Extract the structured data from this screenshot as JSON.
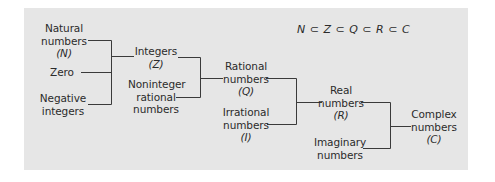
{
  "diagram": {
    "formula": "N ⊂ Z ⊂ Q ⊂ R ⊂ C",
    "colors": {
      "panel": "#e6e6e6",
      "text": "#2b2b2b",
      "line": "#3a3a3a"
    },
    "nodes": {
      "natural": {
        "line1": "Natural",
        "line2": "numbers",
        "symbol": "(N)"
      },
      "zero": {
        "line1": "Zero"
      },
      "negative": {
        "line1": "Negative",
        "line2": "integers"
      },
      "integers": {
        "line1": "Integers",
        "symbol": "(Z)"
      },
      "noninteger": {
        "line1": "Noninteger",
        "line2": "rational",
        "line3": "numbers"
      },
      "rational": {
        "line1": "Rational",
        "line2": "numbers",
        "symbol": "(Q)"
      },
      "irrational": {
        "line1": "Irrational",
        "line2": "numbers",
        "symbol": "(I)"
      },
      "real": {
        "line1": "Real",
        "line2": "numbers",
        "symbol": "(R)"
      },
      "imaginary": {
        "line1": "Imaginary",
        "line2": "numbers"
      },
      "complex": {
        "line1": "Complex",
        "line2": "numbers",
        "symbol": "(C)"
      }
    },
    "edges": [
      {
        "from": [
          "natural",
          "zero",
          "negative"
        ],
        "to": "integers"
      },
      {
        "from": [
          "integers",
          "noninteger"
        ],
        "to": "rational"
      },
      {
        "from": [
          "rational",
          "irrational"
        ],
        "to": "real"
      },
      {
        "from": [
          "real",
          "imaginary"
        ],
        "to": "complex"
      }
    ]
  }
}
